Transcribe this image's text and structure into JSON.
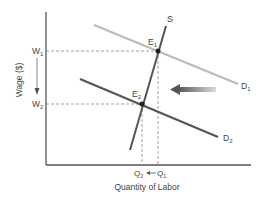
{
  "diagram": {
    "type": "supply-demand",
    "y_axis_label": "Wage ($)",
    "x_axis_label": "Quantity of Labor",
    "wage_labels": {
      "w1": "W",
      "w1_sub": "1",
      "w2": "W",
      "w2_sub": "2"
    },
    "quantity_labels": {
      "q1": "Q",
      "q1_sub": "1",
      "q2": "Q",
      "q2_sub": "2"
    },
    "curves": {
      "supply": "S",
      "demand1": "D",
      "demand1_sub": "1",
      "demand2": "D",
      "demand2_sub": "2"
    },
    "equilibria": {
      "e1": "E",
      "e1_sub": "1",
      "e2": "E",
      "e2_sub": "2"
    },
    "colors": {
      "axis": "#555555",
      "supply": "#555555",
      "demand1": "#bbbbbb",
      "demand2": "#555555",
      "dashed": "#888888",
      "shift_arrow": "#666666"
    }
  }
}
